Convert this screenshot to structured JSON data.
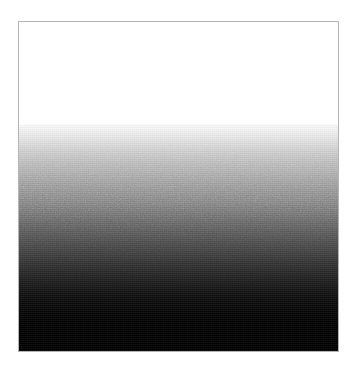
{
  "page": {
    "background_color": "#ffffff",
    "width": 355,
    "height": 371
  },
  "image_frame": {
    "name": "grayscale-gradient-image",
    "border_color": "#b4b4b4",
    "border_width_px": 1,
    "left_px": 18,
    "top_px": 21,
    "width_px": 321,
    "height_px": 331,
    "alt_text": ""
  },
  "gradient": {
    "type": "linear-vertical",
    "direction": "top-to-bottom",
    "start_color": "#ffffff",
    "end_color": "#000000",
    "white_plateau_end_pct": 31,
    "black_plateau_start_pct": 92,
    "has_dither_noise": true,
    "stops": [
      {
        "position_pct": 0,
        "color": "#ffffff"
      },
      {
        "position_pct": 31,
        "color": "#ffffff"
      },
      {
        "position_pct": 33,
        "color": "#f4f4f4"
      },
      {
        "position_pct": 36,
        "color": "#e2e2e2"
      },
      {
        "position_pct": 39,
        "color": "#cfcfcf"
      },
      {
        "position_pct": 42.5,
        "color": "#bcbcbc"
      },
      {
        "position_pct": 46,
        "color": "#ababab"
      },
      {
        "position_pct": 49.5,
        "color": "#9a9a9a"
      },
      {
        "position_pct": 53,
        "color": "#898989"
      },
      {
        "position_pct": 56.5,
        "color": "#787878"
      },
      {
        "position_pct": 60,
        "color": "#676767"
      },
      {
        "position_pct": 63.5,
        "color": "#575757"
      },
      {
        "position_pct": 67,
        "color": "#484848"
      },
      {
        "position_pct": 70.5,
        "color": "#3a3a3a"
      },
      {
        "position_pct": 74,
        "color": "#2c2c2c"
      },
      {
        "position_pct": 77.5,
        "color": "#1f1f1f"
      },
      {
        "position_pct": 81,
        "color": "#141414"
      },
      {
        "position_pct": 84.5,
        "color": "#0a0a0a"
      },
      {
        "position_pct": 88,
        "color": "#050505"
      },
      {
        "position_pct": 92,
        "color": "#000000"
      },
      {
        "position_pct": 100,
        "color": "#000000"
      }
    ]
  }
}
